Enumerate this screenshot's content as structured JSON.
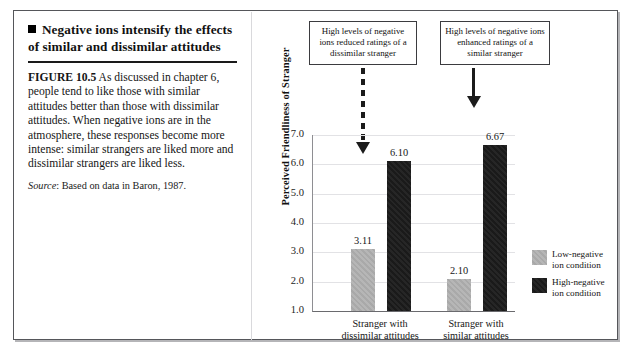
{
  "figure": {
    "heading": "Negative ions intensify the effects of similar and dissimilar attitudes",
    "caption_label": "FIGURE 10.5",
    "caption_text": " As discussed in chapter 6, people tend to like those with similar attitudes better than those with dissimilar attitudes. When negative ions are in the atmosphere, these responses become more intense: similar strangers are liked more and dissimilar strangers are liked less.",
    "source_label": "Source",
    "source_text": ": Based on data in Baron, 1987."
  },
  "callouts": [
    {
      "id": "dissimilar",
      "text": "High levels of negative ions reduced ratings of a dissimilar stranger",
      "arrow": "dashed-down-arrow"
    },
    {
      "id": "similar",
      "text": "High levels of negative ions enhanced ratings of a similar stranger",
      "arrow": "solid-down-arrow"
    }
  ],
  "chart_data": {
    "type": "bar",
    "title": "",
    "xlabel": "",
    "ylabel": "Perceived Friendliness of Stranger",
    "categories": [
      "Stranger with dissimilar attitudes",
      "Stranger with similar attitudes"
    ],
    "category_lines": [
      [
        "Stranger with",
        "dissimilar attitudes"
      ],
      [
        "Stranger with",
        "similar attitudes"
      ]
    ],
    "series": [
      {
        "name": "Low-negative ion condition",
        "name_lines": [
          "Low-negative",
          "ion condition"
        ],
        "color": "#ababab",
        "values": [
          3.11,
          2.1
        ]
      },
      {
        "name": "High-negative ion condition",
        "name_lines": [
          "High-negative",
          "ion condition"
        ],
        "color": "#1f1f1f",
        "values": [
          6.1,
          6.67
        ]
      }
    ],
    "value_labels": [
      "3.11",
      "2.10",
      "6.10",
      "6.67"
    ],
    "ylim": [
      1.0,
      7.0
    ],
    "yticks": [
      7.0,
      6.0,
      5.0,
      4.0,
      3.0,
      2.0,
      1.0
    ],
    "ytick_labels": [
      "7.0",
      "6.0",
      "5.0",
      "4.0",
      "3.0",
      "2.0",
      "1.0"
    ],
    "grid": true,
    "legend_position": "right"
  },
  "colors": {
    "frame": "#55565a",
    "rule": "#1a1a1a",
    "grid": "#e2e2e5",
    "low_series": "#ababab",
    "high_series": "#1f1f1f"
  }
}
